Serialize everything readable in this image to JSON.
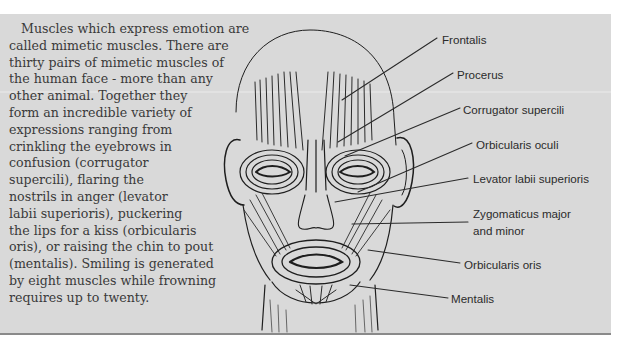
{
  "article": {
    "paragraph_lines": [
      "Muscles which express emotion are",
      "called mimetic muscles. There are",
      "thirty pairs of mimetic muscles of",
      "the human face - more than any",
      "other animal. Together they",
      "form an incredible variety of",
      "expressions ranging from",
      "crinkling the eyebrows in",
      "confusion (corrugator",
      "supercili), flaring the",
      "nostrils in anger (levator",
      "labii superioris), puckering",
      "the lips for a kiss (orbicularis",
      "oris), or raising the chin to pout",
      "(mentalis). Smiling is generated",
      "by eight muscles while frowning",
      "requires up to twenty."
    ]
  },
  "figure": {
    "labels": [
      {
        "text": "Frontalis"
      },
      {
        "text": "Procerus"
      },
      {
        "text": "Corrugator supercili"
      },
      {
        "text": "Orbicularis oculi"
      },
      {
        "text": "Levator labii superioris"
      },
      {
        "text": "Zygomaticus major",
        "text2": "and minor"
      },
      {
        "text": "Orbicularis oris"
      },
      {
        "text": "Mentalis"
      }
    ]
  },
  "colors": {
    "panel_background": "#d9d9d9",
    "panel_border": "#8a8a8a",
    "text": "#3a3a3a",
    "label_text": "#2b2b2b",
    "illustration_ink": "#1e1e1e"
  }
}
